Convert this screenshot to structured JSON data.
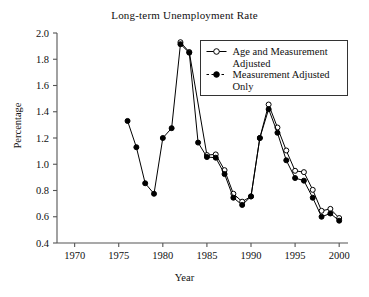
{
  "chart_data": {
    "type": "line",
    "title": "Long-term Unemployment Rate",
    "xlabel": "Year",
    "ylabel": "Percentage",
    "xlim": [
      1968,
      2001
    ],
    "ylim": [
      0.4,
      2.0
    ],
    "xticks": [
      1970,
      1975,
      1980,
      1985,
      1990,
      1995,
      2000
    ],
    "xtick_labels": [
      "1970",
      "1975",
      "1980",
      "1985",
      "1990",
      "1995",
      "2000"
    ],
    "yticks": [
      0.4,
      0.6,
      0.8,
      1.0,
      1.2,
      1.4,
      1.6,
      1.8,
      2.0
    ],
    "ytick_labels": [
      "0.4",
      "0.6",
      "0.8",
      "1.0",
      "1.2",
      "1.4",
      "1.6",
      "1.8",
      "2.0"
    ],
    "grid": false,
    "legend_position": "top-right",
    "series": [
      {
        "name": "Age and Measurement Adjusted",
        "marker": "open-circle",
        "line": "solid",
        "color": "#000000",
        "x": [
          1982,
          1983,
          1985,
          1986,
          1987,
          1988,
          1989,
          1990,
          1991,
          1992,
          1993,
          1994,
          1995,
          1996,
          1997,
          1998,
          1999,
          2000
        ],
        "values": [
          1.93,
          1.855,
          1.07,
          1.075,
          0.955,
          0.775,
          0.715,
          0.755,
          1.2,
          1.455,
          1.28,
          1.105,
          0.95,
          0.94,
          0.805,
          0.645,
          0.66,
          0.59
        ]
      },
      {
        "name": "Measurement Adjusted Only",
        "marker": "filled-circle",
        "line": "dashed",
        "color": "#000000",
        "x": [
          1976,
          1977,
          1978,
          1979,
          1980,
          1981,
          1982,
          1983,
          1984,
          1985,
          1986,
          1987,
          1988,
          1989,
          1990,
          1991,
          1992,
          1993,
          1994,
          1995,
          1996,
          1997,
          1998,
          1999,
          2000
        ],
        "values": [
          1.33,
          1.13,
          0.855,
          0.775,
          1.2,
          1.275,
          1.915,
          1.85,
          1.165,
          1.055,
          1.05,
          0.925,
          0.745,
          0.69,
          0.755,
          1.2,
          1.42,
          1.24,
          1.03,
          0.895,
          0.875,
          0.745,
          0.6,
          0.625,
          0.57
        ]
      }
    ]
  },
  "legend": {
    "entries": [
      {
        "label_line1": "Age and Measurement",
        "label_line2": "Adjusted",
        "marker": "open-circle",
        "line": "solid"
      },
      {
        "label_line1": "Measurement Adjusted",
        "label_line2": "Only",
        "marker": "filled-circle",
        "line": "dashed"
      }
    ]
  }
}
